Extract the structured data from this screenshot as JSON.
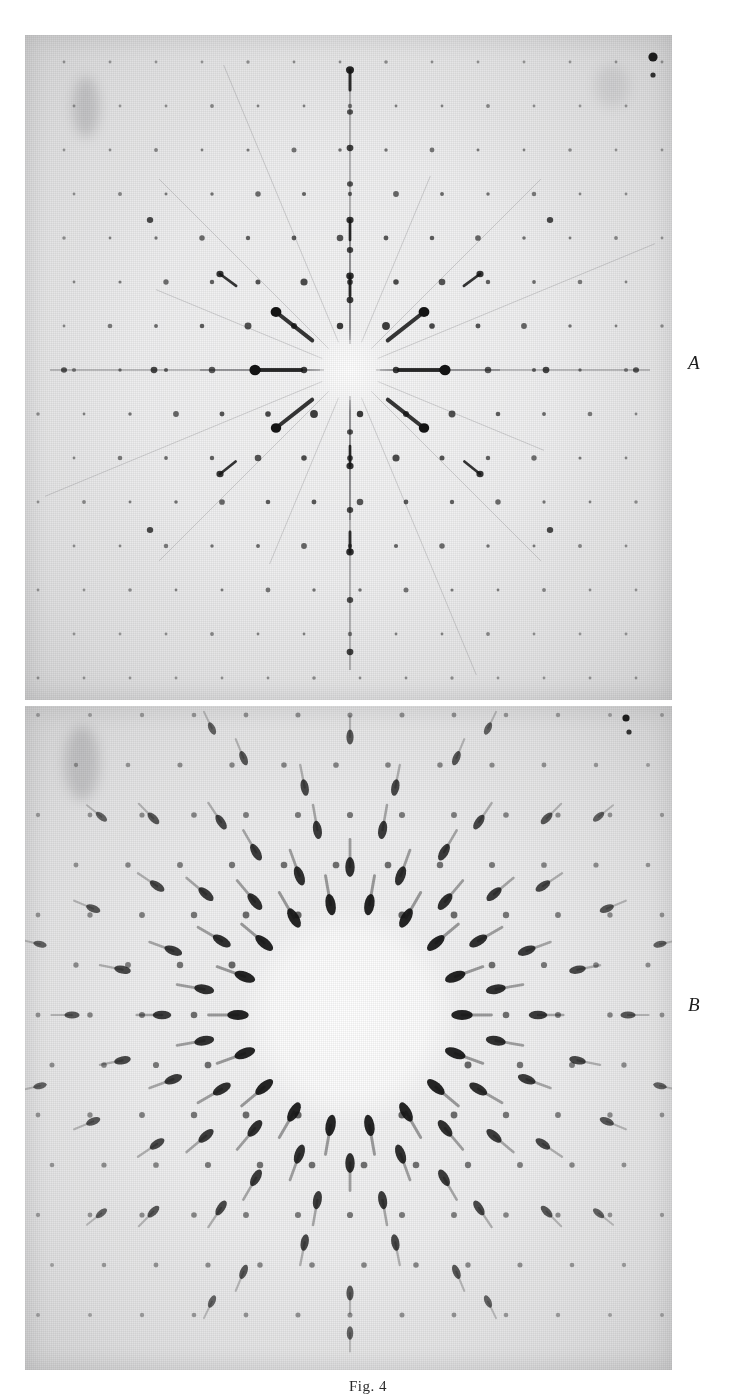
{
  "figure": {
    "caption": "Fig. 4",
    "background_color": "#ffffff",
    "plate_background": "#ececed",
    "spot_color": "#141414"
  },
  "panels": [
    {
      "id": "A",
      "label": "A",
      "type": "laue-diffraction-photograph",
      "description": "Laue X-ray diffraction pattern with sharp central region, radial streaks and a lattice of sharp spots",
      "bounds": {
        "x": 25,
        "y": 35,
        "width": 647,
        "height": 665
      },
      "center": {
        "x": 325,
        "y": 335
      },
      "center_void_radius": 26,
      "label_position": {
        "x": 688,
        "y": 360
      }
    },
    {
      "id": "B",
      "label": "B",
      "type": "laue-diffraction-photograph",
      "description": "Laue X-ray diffraction pattern with large bright circular centre ringed by elongated radial spots",
      "bounds": {
        "x": 25,
        "y": 706,
        "width": 647,
        "height": 664
      },
      "center": {
        "x": 325,
        "y": 309
      },
      "center_void_radius": 92,
      "label_position": {
        "x": 688,
        "y": 1002
      }
    }
  ],
  "caption_position": {
    "y": 1378
  },
  "chart_data": {
    "type": "scatter",
    "title": "Fig. 4",
    "xlabel": "",
    "ylabel": "",
    "panel_A": {
      "label": "A",
      "symmetry": "approximately 4-fold / pseudo-hexagonal radial",
      "beam_stop_radius": 26,
      "streak_count": 16,
      "spots": [
        {
          "x": 0,
          "y": -300,
          "r": 4.0,
          "i": 0.92
        },
        {
          "x": 0,
          "y": -258,
          "r": 3.0,
          "i": 0.7
        },
        {
          "x": 0,
          "y": -222,
          "r": 3.4,
          "i": 0.8
        },
        {
          "x": 0,
          "y": -186,
          "r": 3.0,
          "i": 0.7
        },
        {
          "x": 0,
          "y": -150,
          "r": 3.6,
          "i": 0.85
        },
        {
          "x": 0,
          "y": -120,
          "r": 3.2,
          "i": 0.78
        },
        {
          "x": 0,
          "y": -94,
          "r": 3.8,
          "i": 0.88
        },
        {
          "x": 0,
          "y": -70,
          "r": 3.4,
          "i": 0.82
        },
        {
          "x": 0,
          "y": 62,
          "r": 3.0,
          "i": 0.72
        },
        {
          "x": 0,
          "y": 96,
          "r": 3.6,
          "i": 0.86
        },
        {
          "x": 0,
          "y": 140,
          "r": 3.2,
          "i": 0.76
        },
        {
          "x": 0,
          "y": 182,
          "r": 3.8,
          "i": 0.88
        },
        {
          "x": 0,
          "y": 230,
          "r": 3.2,
          "i": 0.74
        },
        {
          "x": 0,
          "y": 282,
          "r": 3.4,
          "i": 0.8
        },
        {
          "x": -95,
          "y": 0,
          "r": 5.6,
          "i": 1.0
        },
        {
          "x": 95,
          "y": 0,
          "r": 5.6,
          "i": 1.0
        },
        {
          "x": -196,
          "y": 0,
          "r": 3.4,
          "i": 0.78
        },
        {
          "x": 196,
          "y": 0,
          "r": 3.4,
          "i": 0.78
        },
        {
          "x": -286,
          "y": 0,
          "r": 3.0,
          "i": 0.7
        },
        {
          "x": 286,
          "y": 0,
          "r": 3.0,
          "i": 0.7
        },
        {
          "x": -74,
          "y": -58,
          "r": 5.4,
          "i": 1.0
        },
        {
          "x": 74,
          "y": -58,
          "r": 5.4,
          "i": 1.0
        },
        {
          "x": -74,
          "y": 58,
          "r": 5.2,
          "i": 1.0
        },
        {
          "x": 74,
          "y": 58,
          "r": 5.2,
          "i": 1.0
        },
        {
          "x": -130,
          "y": -96,
          "r": 3.6,
          "i": 0.85
        },
        {
          "x": 130,
          "y": -96,
          "r": 3.6,
          "i": 0.85
        },
        {
          "x": -130,
          "y": 104,
          "r": 3.6,
          "i": 0.85
        },
        {
          "x": 130,
          "y": 104,
          "r": 3.6,
          "i": 0.85
        },
        {
          "x": -200,
          "y": -150,
          "r": 3.2,
          "i": 0.76
        },
        {
          "x": 200,
          "y": -150,
          "r": 3.2,
          "i": 0.76
        },
        {
          "x": -200,
          "y": 160,
          "r": 3.2,
          "i": 0.76
        },
        {
          "x": 200,
          "y": 160,
          "r": 3.2,
          "i": 0.76
        }
      ]
    },
    "panel_B": {
      "label": "B",
      "symmetry": "radial, ring of elongated spots about a bright central disc",
      "beam_stop_radius": 92,
      "ring_radii": [
        112,
        148,
        188,
        232,
        278,
        318
      ],
      "spots_per_ring": [
        18,
        18,
        18,
        16,
        16,
        14
      ],
      "spot_elongation": "radial, tails pointing outward"
    }
  }
}
